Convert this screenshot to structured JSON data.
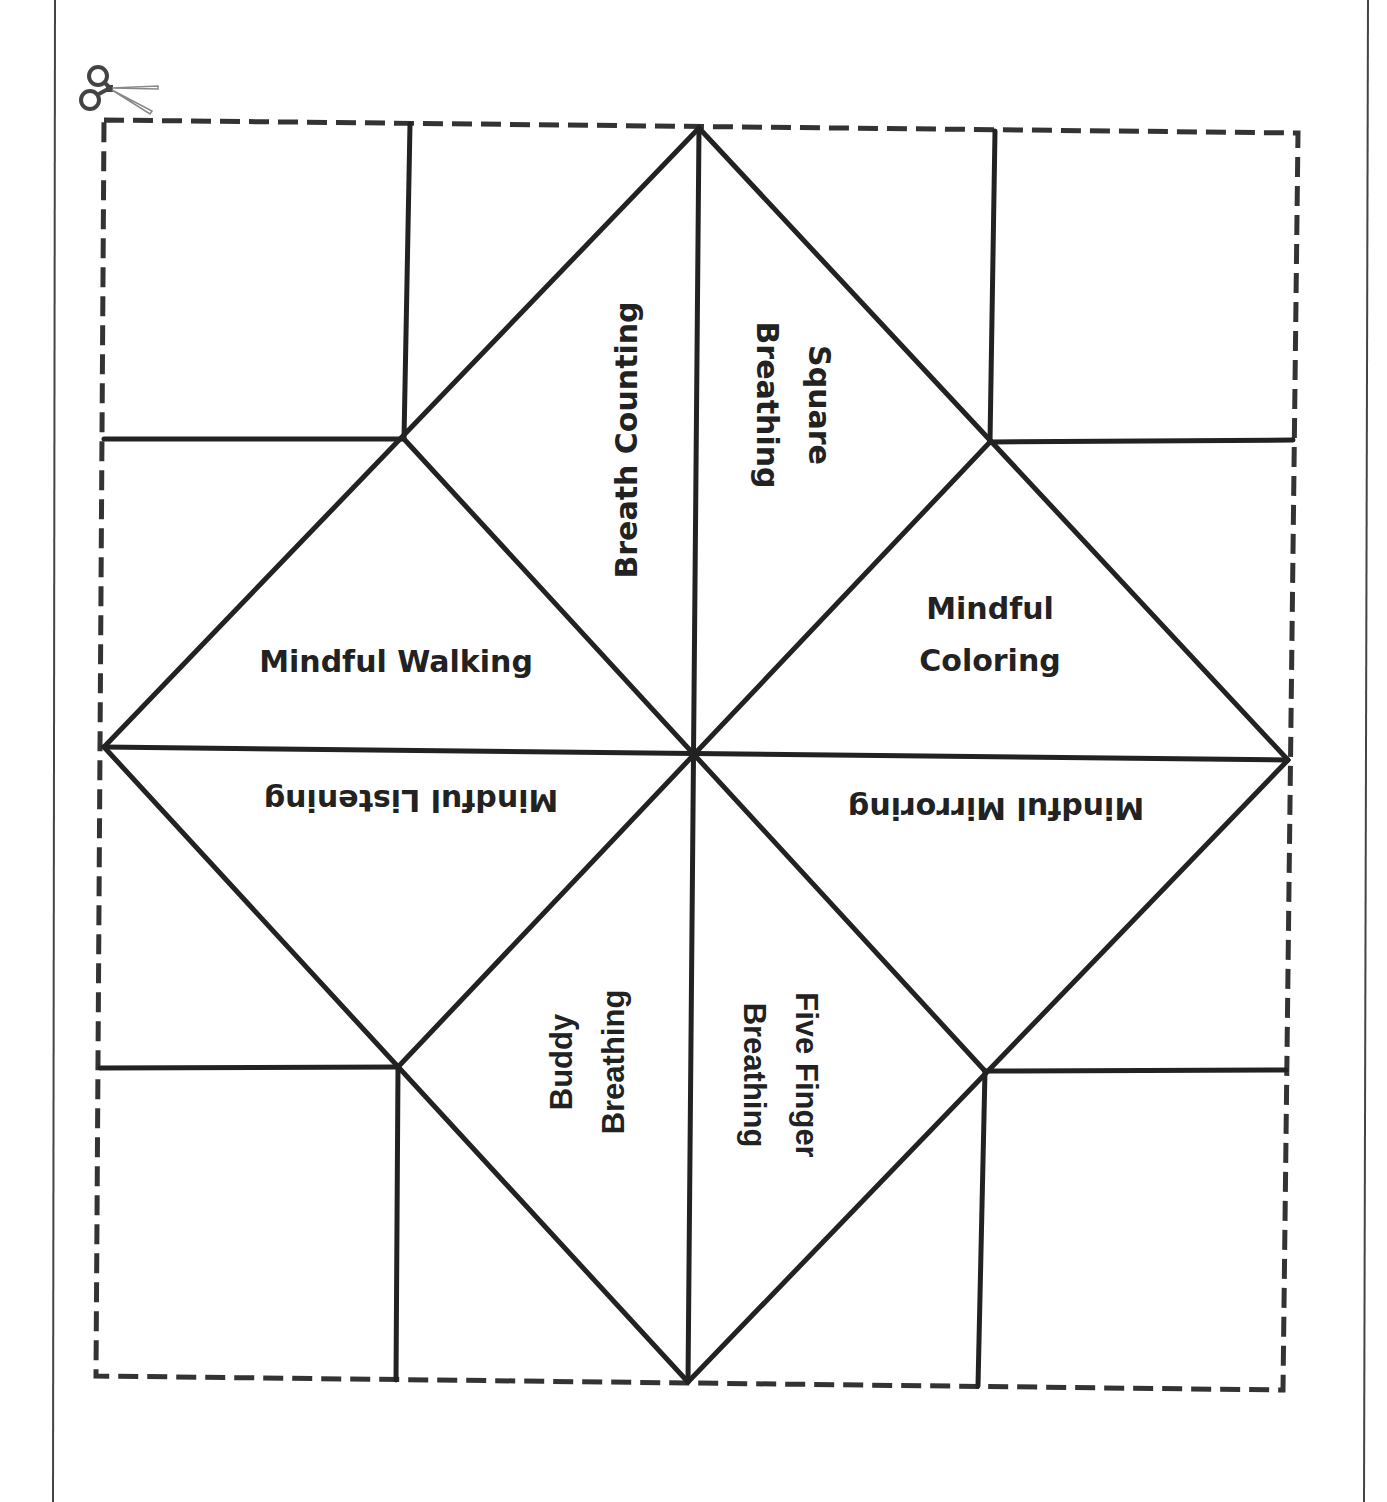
{
  "page": {
    "background": "#ffffff",
    "border_color": "#444444",
    "left_border_x": 55,
    "right_border_x": 1368
  },
  "cut_line": {
    "icon": "scissors-icon",
    "color": "#333333",
    "corners": {
      "top_left": [
        104,
        120
      ],
      "top_right": [
        1298,
        133
      ],
      "bottom_right": [
        1283,
        1390
      ],
      "bottom_left": [
        96,
        1376
      ]
    }
  },
  "fortune_teller": {
    "line_color": "#222222",
    "vertices": {
      "top": [
        699,
        128
      ],
      "bottom": [
        688,
        1382
      ],
      "left": [
        104,
        747
      ],
      "right": [
        1288,
        760
      ],
      "center": [
        693,
        753
      ],
      "upper_left": [
        404,
        439
      ],
      "upper_right": [
        990,
        442
      ],
      "lower_left": [
        398,
        1067
      ],
      "lower_right": [
        985,
        1071
      ]
    },
    "flap_lines": [
      {
        "from": [
          410,
          124
        ],
        "to": [
          404,
          439
        ]
      },
      {
        "from": [
          104,
          439
        ],
        "to": [
          404,
          439
        ]
      },
      {
        "from": [
          995,
          131
        ],
        "to": [
          990,
          442
        ]
      },
      {
        "from": [
          990,
          442
        ],
        "to": [
          1293,
          440
        ]
      },
      {
        "from": [
          100,
          1068
        ],
        "to": [
          398,
          1067
        ]
      },
      {
        "from": [
          398,
          1067
        ],
        "to": [
          396,
          1380
        ]
      },
      {
        "from": [
          985,
          1071
        ],
        "to": [
          1286,
          1070
        ]
      },
      {
        "from": [
          985,
          1071
        ],
        "to": [
          978,
          1386
        ]
      }
    ]
  },
  "sections": [
    {
      "id": "breath-counting",
      "lines": [
        "Breath Counting"
      ],
      "x": 627,
      "y": 440,
      "rotate": -90,
      "style": "label"
    },
    {
      "id": "square-breathing",
      "lines": [
        "Square",
        "Breathing"
      ],
      "x": 793,
      "y": 405,
      "rotate": 90,
      "style": "label"
    },
    {
      "id": "mindful-walking",
      "lines": [
        "Mindful Walking"
      ],
      "x": 396,
      "y": 662,
      "rotate": 0,
      "style": "label"
    },
    {
      "id": "mindful-coloring",
      "lines": [
        "Mindful",
        "Coloring"
      ],
      "x": 990,
      "y": 635,
      "rotate": 0,
      "style": "label"
    },
    {
      "id": "mindful-listening",
      "lines": [
        "Mindful Listening"
      ],
      "x": 411,
      "y": 800,
      "rotate": 180,
      "style": "label"
    },
    {
      "id": "mindful-mirroring",
      "lines": [
        "Mindful Mirroring"
      ],
      "x": 996,
      "y": 808,
      "rotate": 180,
      "style": "label"
    },
    {
      "id": "buddy-breathing",
      "lines": [
        "Buddy",
        "Breathing"
      ],
      "x": 588,
      "y": 1062,
      "rotate": -90,
      "style": "label-alt"
    },
    {
      "id": "five-finger-breathing",
      "lines": [
        "Five Finger",
        "Breathing"
      ],
      "x": 780,
      "y": 1075,
      "rotate": 90,
      "style": "label-alt"
    }
  ]
}
